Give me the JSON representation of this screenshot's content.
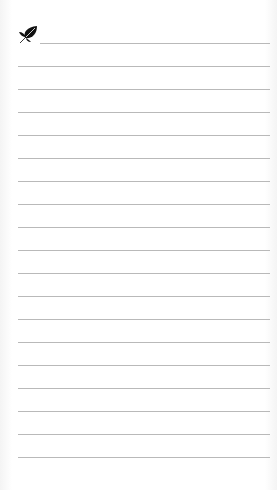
{
  "page": {
    "type": "lined-notepad",
    "logo_icon": "leaf-icon",
    "line_color": "#b9b9b9",
    "background": "#ffffff",
    "lines": [
      43,
      66,
      89,
      112,
      135,
      158,
      181,
      204,
      227,
      250,
      273,
      296,
      319,
      342,
      365,
      388,
      411,
      434,
      457
    ]
  }
}
